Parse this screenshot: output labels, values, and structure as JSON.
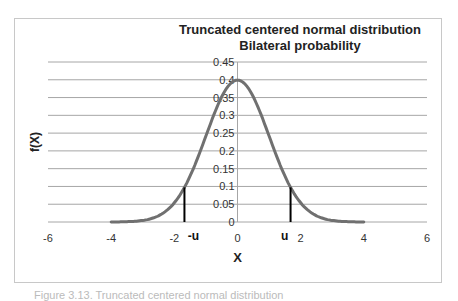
{
  "chart_data": {
    "type": "line",
    "title": "Truncated centered normal distribution",
    "subtitle": "Bilateral probability",
    "xlabel": "X",
    "ylabel": "f(X)",
    "xlim": [
      -6,
      6
    ],
    "ylim": [
      0,
      0.45
    ],
    "x_ticks": [
      "-6",
      "-4",
      "-2",
      "0",
      "2",
      "4",
      "6"
    ],
    "y_ticks": [
      "0",
      "0.05",
      "0.1",
      "0.15",
      "0.2",
      "0.25",
      "0.3",
      "0.35",
      "0.4",
      "0.45"
    ],
    "grid": true,
    "legend": "none",
    "series": [
      {
        "name": "f(X)",
        "x": [
          -4,
          -3.5,
          -3,
          -2.5,
          -2,
          -1.5,
          -1,
          -0.5,
          0,
          0.5,
          1,
          1.5,
          2,
          2.5,
          3,
          3.5,
          4
        ],
        "values": [
          0.0001,
          0.0009,
          0.0044,
          0.0175,
          0.054,
          0.1295,
          0.242,
          0.3521,
          0.3989,
          0.3521,
          0.242,
          0.1295,
          0.054,
          0.0175,
          0.0044,
          0.0009,
          0.0001
        ],
        "color": "#707070"
      }
    ],
    "annotations": [
      {
        "label": "-u",
        "x": -1.68,
        "y": 0.1
      },
      {
        "label": "u",
        "x": 1.68,
        "y": 0.1
      }
    ]
  },
  "caption": "Figure 3.13. Truncated centered normal distribution"
}
